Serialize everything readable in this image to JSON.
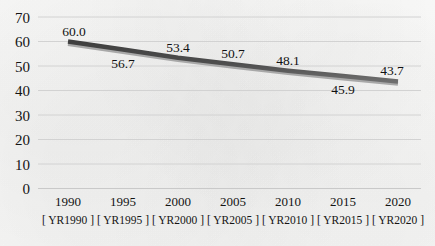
{
  "chart_data": {
    "type": "line",
    "title": "",
    "subtitle": "",
    "xlabel": "",
    "ylabel": "",
    "categories": [
      "1990",
      "1995",
      "2000",
      "2005",
      "2010",
      "2015",
      "2020"
    ],
    "series_codes": [
      "[ YR1990 ]",
      "[ YR1995 ]",
      "[ YR2000 ]",
      "[ YR2005 ]",
      "[ YR2010 ]",
      "[ YR2015 ]",
      "[ YR2020 ]"
    ],
    "values": [
      60.0,
      56.7,
      53.4,
      50.7,
      48.1,
      45.9,
      43.7
    ],
    "data_labels": [
      "60.0",
      "56.7",
      "53.4",
      "50.7",
      "48.1",
      "45.9",
      "43.7"
    ],
    "data_label_positions": [
      "above",
      "below",
      "above",
      "above",
      "above",
      "below",
      "above"
    ],
    "ylim": [
      0,
      70
    ],
    "ytick_values": [
      70,
      60,
      50,
      40,
      30,
      20,
      10,
      0
    ],
    "ytick_labels": [
      "70",
      "60",
      "50",
      "40",
      "30",
      "20",
      "10",
      "0"
    ],
    "grid": true,
    "grid_axis": "y",
    "legend": false,
    "legend_position": "none",
    "series": [
      {
        "name": "",
        "values": [
          60.0,
          56.7,
          53.4,
          50.7,
          48.1,
          45.9,
          43.7
        ],
        "color": "#4e4e4e",
        "line_width": 4.5,
        "markers": false
      }
    ],
    "colors": {
      "line": "#4e4e4e",
      "line_shadow": "#a8a8a8",
      "gridline": "#d2d2d2",
      "axis": "#c9c9c9",
      "text": "#141414",
      "background": "#fbfbfa"
    }
  }
}
